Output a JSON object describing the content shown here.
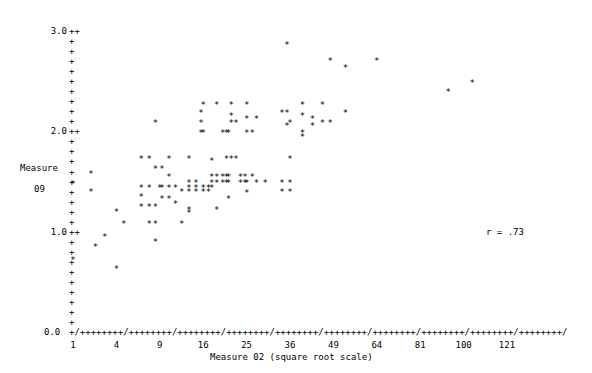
{
  "chart_data": {
    "type": "scatter",
    "title": "",
    "xlabel": "Measure 02 (square root scale)",
    "ylabel_line1": "Measure",
    "ylabel_line2": "09",
    "annotation": "r = .73",
    "correlation": 0.73,
    "grid": false,
    "legend": "none",
    "marker_glyph": "*",
    "axis_glyph_tick": "+",
    "axis_glyph_major": "/",
    "xscale": "sqrt",
    "xlim": [
      1,
      121
    ],
    "ylim": [
      0.0,
      3.0
    ],
    "xticks": [
      1,
      4,
      9,
      16,
      25,
      36,
      49,
      64,
      81,
      100,
      121
    ],
    "xtick_labels": [
      "1",
      "4",
      "9",
      "16",
      "25",
      "36",
      "49",
      "64",
      "81",
      "100",
      "121"
    ],
    "yticks": [
      0.0,
      1.0,
      2.0,
      3.0
    ],
    "ytick_labels": [
      "0.0",
      "1.0",
      "2.0",
      "3.0"
    ],
    "y_minor_step": 0.1,
    "n_points": 132,
    "points": [
      [
        1.0,
        1.48
      ],
      [
        1.0,
        0.72
      ],
      [
        2.0,
        1.58
      ],
      [
        2.0,
        1.4
      ],
      [
        2.3,
        0.85
      ],
      [
        3.0,
        0.95
      ],
      [
        4.0,
        1.2
      ],
      [
        4.0,
        0.63
      ],
      [
        4.7,
        1.08
      ],
      [
        6.6,
        1.72
      ],
      [
        6.6,
        1.44
      ],
      [
        6.6,
        1.35
      ],
      [
        6.6,
        1.25
      ],
      [
        7.6,
        1.72
      ],
      [
        7.6,
        1.44
      ],
      [
        7.6,
        1.25
      ],
      [
        7.6,
        1.08
      ],
      [
        8.4,
        2.08
      ],
      [
        8.4,
        1.63
      ],
      [
        8.4,
        1.25
      ],
      [
        8.4,
        1.08
      ],
      [
        8.4,
        0.9
      ],
      [
        9.0,
        1.44
      ],
      [
        9.3,
        1.63
      ],
      [
        9.3,
        1.44
      ],
      [
        9.3,
        1.33
      ],
      [
        10.3,
        1.72
      ],
      [
        10.3,
        1.55
      ],
      [
        10.3,
        1.44
      ],
      [
        10.3,
        1.33
      ],
      [
        11.3,
        1.44
      ],
      [
        11.3,
        1.28
      ],
      [
        12.3,
        1.4
      ],
      [
        12.3,
        1.08
      ],
      [
        13.5,
        1.72
      ],
      [
        13.5,
        1.49
      ],
      [
        13.5,
        1.44
      ],
      [
        13.5,
        1.4
      ],
      [
        13.5,
        1.22
      ],
      [
        13.5,
        1.19
      ],
      [
        14.7,
        1.49
      ],
      [
        14.7,
        1.44
      ],
      [
        14.7,
        1.4
      ],
      [
        15.6,
        2.18
      ],
      [
        15.6,
        2.08
      ],
      [
        15.6,
        1.98
      ],
      [
        16.0,
        2.26
      ],
      [
        16.0,
        1.98
      ],
      [
        16.0,
        1.44
      ],
      [
        16.0,
        1.4
      ],
      [
        17.0,
        1.44
      ],
      [
        17.0,
        1.4
      ],
      [
        17.6,
        1.7
      ],
      [
        17.6,
        1.55
      ],
      [
        17.6,
        1.49
      ],
      [
        17.6,
        1.44
      ],
      [
        18.6,
        2.26
      ],
      [
        18.6,
        1.55
      ],
      [
        18.6,
        1.49
      ],
      [
        18.6,
        1.22
      ],
      [
        19.8,
        1.98
      ],
      [
        19.8,
        1.55
      ],
      [
        19.8,
        1.49
      ],
      [
        20.6,
        1.98
      ],
      [
        20.6,
        1.72
      ],
      [
        20.6,
        1.55
      ],
      [
        20.6,
        1.49
      ],
      [
        21.0,
        1.98
      ],
      [
        21.0,
        1.55
      ],
      [
        21.0,
        1.49
      ],
      [
        21.0,
        1.33
      ],
      [
        21.6,
        2.26
      ],
      [
        21.6,
        2.15
      ],
      [
        21.6,
        2.08
      ],
      [
        21.6,
        1.72
      ],
      [
        22.6,
        2.08
      ],
      [
        22.6,
        1.72
      ],
      [
        23.6,
        1.55
      ],
      [
        23.6,
        1.49
      ],
      [
        24.6,
        1.55
      ],
      [
        24.6,
        1.49
      ],
      [
        25.0,
        2.26
      ],
      [
        25.0,
        2.12
      ],
      [
        25.0,
        1.98
      ],
      [
        25.0,
        1.49
      ],
      [
        25.0,
        1.39
      ],
      [
        26.3,
        1.98
      ],
      [
        26.3,
        1.55
      ],
      [
        27.3,
        2.12
      ],
      [
        27.3,
        1.49
      ],
      [
        29.5,
        1.49
      ],
      [
        33.8,
        2.18
      ],
      [
        33.8,
        1.49
      ],
      [
        33.8,
        1.4
      ],
      [
        35.2,
        2.86
      ],
      [
        35.2,
        2.18
      ],
      [
        35.2,
        2.05
      ],
      [
        36.0,
        2.08
      ],
      [
        36.0,
        1.72
      ],
      [
        36.0,
        1.49
      ],
      [
        36.0,
        1.4
      ],
      [
        39.5,
        2.26
      ],
      [
        39.5,
        2.15
      ],
      [
        39.5,
        1.98
      ],
      [
        39.5,
        1.94
      ],
      [
        42.5,
        2.12
      ],
      [
        42.5,
        2.05
      ],
      [
        45.5,
        2.26
      ],
      [
        45.5,
        2.08
      ],
      [
        48.0,
        2.7
      ],
      [
        48.0,
        2.08
      ],
      [
        53.0,
        2.63
      ],
      [
        53.0,
        2.18
      ],
      [
        64.0,
        2.7
      ],
      [
        93.0,
        2.39
      ],
      [
        104.0,
        2.48
      ]
    ]
  },
  "geometry": {
    "x_origin_px": 73,
    "x_major_spacing_px": 43.4,
    "y_zero_px": 332,
    "y_unit_px": 100.3
  }
}
